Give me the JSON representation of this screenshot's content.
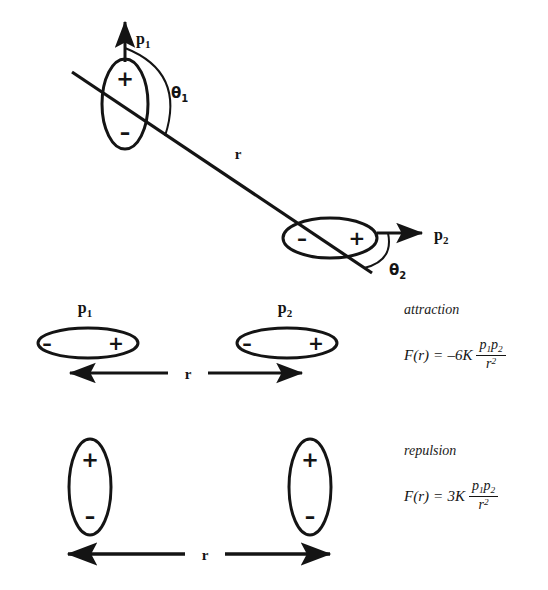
{
  "figure": {
    "line_color": "#141414",
    "background": "#ffffff"
  },
  "panels": {
    "general": {
      "name": "general-orientation-panel",
      "dipole1": {
        "label": "p",
        "label_sub": "1",
        "orientation": "vertical",
        "charge_top": "+",
        "charge_bottom": "–",
        "arrow_direction": "up",
        "angle_label": "θ",
        "angle_sub": "1"
      },
      "dipole2": {
        "label": "p",
        "label_sub": "2",
        "orientation": "horizontal",
        "charge_left": "–",
        "charge_right": "+",
        "arrow_direction": "right",
        "angle_label": "θ",
        "angle_sub": "2"
      },
      "separation_label": "r"
    },
    "attraction": {
      "name": "attraction-panel",
      "condition": "attraction",
      "dipole1": {
        "label": "p",
        "label_sub": "1",
        "orientation": "horizontal",
        "charge_left": "–",
        "charge_right": "+"
      },
      "dipole2": {
        "label": "p",
        "label_sub": "2",
        "orientation": "horizontal",
        "charge_left": "–",
        "charge_right": "+"
      },
      "separation_label": "r",
      "formula": {
        "lhs": "F(r)",
        "equals": "=",
        "coefficient": "–6K",
        "numerator_p1": "p",
        "numerator_p1_sub": "1",
        "numerator_p2": "p",
        "numerator_p2_sub": "2",
        "denominator": "r",
        "denominator_exp": "2"
      }
    },
    "repulsion": {
      "name": "repulsion-panel",
      "condition": "repulsion",
      "dipole1": {
        "orientation": "vertical",
        "charge_top": "+",
        "charge_bottom": "–"
      },
      "dipole2": {
        "orientation": "vertical",
        "charge_top": "+",
        "charge_bottom": "–"
      },
      "separation_label": "r",
      "formula": {
        "lhs": "F(r)",
        "equals": "=",
        "coefficient": "3K",
        "numerator_p1": "p",
        "numerator_p1_sub": "1",
        "numerator_p2": "p",
        "numerator_p2_sub": "2",
        "denominator": "r",
        "denominator_exp": "2"
      }
    }
  }
}
